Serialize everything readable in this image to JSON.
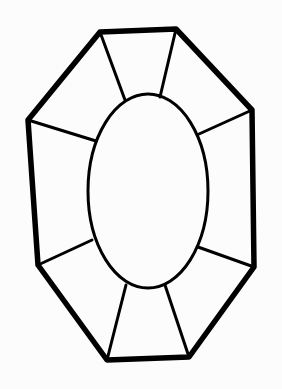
{
  "figure": {
    "background": "#fcfcfc",
    "stroke": "#000000",
    "outline": {
      "points": [
        [
          100,
          32
        ],
        [
          176,
          29
        ],
        [
          252,
          110
        ],
        [
          254,
          267
        ],
        [
          189,
          357
        ],
        [
          107,
          360
        ],
        [
          38,
          265
        ],
        [
          28,
          120
        ]
      ],
      "stroke_width": 5.5
    },
    "table_oval": {
      "cx": 148,
      "cy": 191,
      "rx": 60,
      "ry": 97,
      "stroke_width": 3
    },
    "facet_lines": [
      {
        "x1": 100,
        "y1": 32,
        "x2": 125,
        "y2": 100
      },
      {
        "x1": 176,
        "y1": 29,
        "x2": 160,
        "y2": 97
      },
      {
        "x1": 28,
        "y1": 120,
        "x2": 96,
        "y2": 141
      },
      {
        "x1": 252,
        "y1": 110,
        "x2": 199,
        "y2": 134
      },
      {
        "x1": 38,
        "y1": 265,
        "x2": 92,
        "y2": 240
      },
      {
        "x1": 254,
        "y1": 267,
        "x2": 198,
        "y2": 247
      },
      {
        "x1": 107,
        "y1": 360,
        "x2": 126,
        "y2": 285
      },
      {
        "x1": 189,
        "y1": 357,
        "x2": 165,
        "y2": 285
      }
    ],
    "facet_stroke_width": 3
  }
}
